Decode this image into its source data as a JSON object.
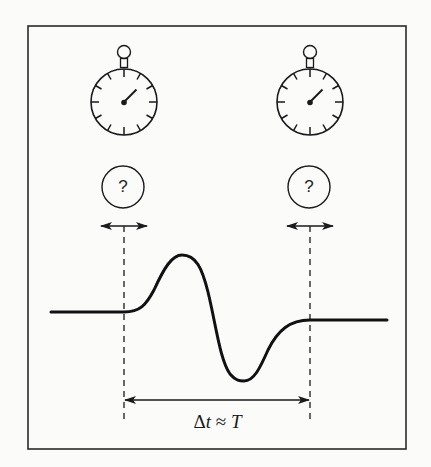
{
  "figure": {
    "frame": {
      "x": 28,
      "y": 26,
      "width": 378,
      "height": 423
    },
    "colors": {
      "background": "#fbfbfa",
      "stroke": "#1a1a1a"
    }
  },
  "stopwatches": [
    {
      "id": "left",
      "center_x": 124,
      "center_y": 102,
      "radius": 33,
      "ticks": 12
    },
    {
      "id": "right",
      "center_x": 310,
      "center_y": 102,
      "radius": 33,
      "ticks": 12
    }
  ],
  "uncertainty_markers": [
    {
      "id": "left",
      "symbol": "?",
      "center_x": 123,
      "center_y": 187
    },
    {
      "id": "right",
      "symbol": "?",
      "center_x": 309,
      "center_y": 187
    }
  ],
  "waveform": {
    "baseline_left_y": 312,
    "baseline_right_y": 320,
    "start_x": 124,
    "end_x": 310,
    "peak": {
      "x": 182,
      "y": 255
    },
    "trough": {
      "x": 244,
      "y": 380
    }
  },
  "interval": {
    "label_delta": "Δ",
    "label_t": "t",
    "label_approx": " ≈ ",
    "label_T": "T",
    "full_label": "Δt ≈ T"
  }
}
